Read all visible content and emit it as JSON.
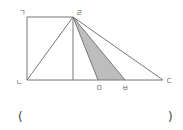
{
  "diagram": {
    "title": "",
    "points": {
      "giyeok": {
        "label": "ㄱ",
        "x": 27,
        "y": 17
      },
      "nieun": {
        "label": "ㄴ",
        "x": 27,
        "y": 80
      },
      "digeut": {
        "label": "ㄷ",
        "x": 163,
        "y": 80
      },
      "rieul": {
        "label": "ㄹ",
        "x": 73,
        "y": 17
      },
      "mieum": {
        "label": "ㅁ",
        "x": 98,
        "y": 80
      },
      "bieup": {
        "label": "ㅂ",
        "x": 125,
        "y": 80
      }
    },
    "foot_of_perpendicular": {
      "x": 73,
      "y": 80
    },
    "shaded_region": {
      "vertices": [
        "ㄹ",
        "ㅁ",
        "ㅂ"
      ],
      "color": "#bdbdbd"
    },
    "line_color": "#777777",
    "segments": [
      "ㄱㄹ",
      "ㄱㄴ",
      "ㄴㄷ",
      "ㄴㄹ",
      "ㄹㄷ",
      "ㄹㅁ",
      "ㄹㅂ",
      "ㄹ-perpendicular"
    ]
  },
  "answer": {
    "open_paren": "(",
    "close_paren": ")",
    "value": ""
  }
}
